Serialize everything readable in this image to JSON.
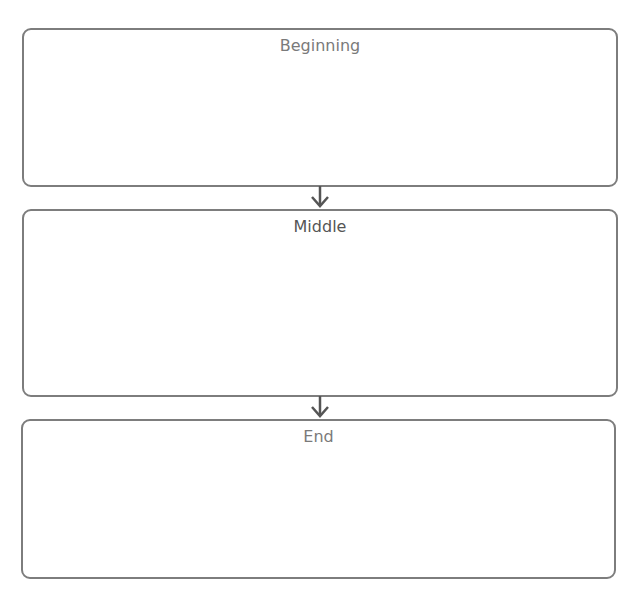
{
  "diagram": {
    "type": "flowchart",
    "boxes": [
      {
        "label": "Beginning"
      },
      {
        "label": "Middle"
      },
      {
        "label": "End"
      }
    ],
    "connectors": [
      {
        "from": "Beginning",
        "to": "Middle",
        "icon": "arrow-down-icon"
      },
      {
        "from": "Middle",
        "to": "End",
        "icon": "arrow-down-icon"
      }
    ],
    "colors": {
      "border": "#7d7d7d",
      "text": "#7a7a7a",
      "text_middle": "#555555",
      "arrow": "#555555"
    }
  }
}
